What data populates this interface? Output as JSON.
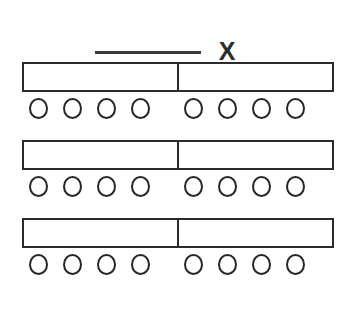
{
  "figure": {
    "background_color": "#ffffff",
    "stroke_color": "#2b2b2b",
    "width": 352,
    "height": 310
  },
  "legend": {
    "line_label": "X",
    "line_color": "#3a3a3a",
    "line_style": "solid"
  },
  "rows": [
    {
      "id": "row-1",
      "bar": {
        "segments": 2,
        "divider_position": "middle"
      },
      "counters": {
        "total": 8,
        "groups": [
          {
            "id": "left",
            "count": 4,
            "items": [
              "circle",
              "circle",
              "circle",
              "circle"
            ]
          },
          {
            "id": "right",
            "count": 4,
            "items": [
              "circle",
              "circle",
              "circle",
              "circle"
            ]
          }
        ]
      }
    },
    {
      "id": "row-2",
      "bar": {
        "segments": 2,
        "divider_position": "middle"
      },
      "counters": {
        "total": 8,
        "groups": [
          {
            "id": "left",
            "count": 4,
            "items": [
              "circle",
              "circle",
              "circle",
              "circle"
            ]
          },
          {
            "id": "right",
            "count": 4,
            "items": [
              "circle",
              "circle",
              "circle",
              "circle"
            ]
          }
        ]
      }
    },
    {
      "id": "row-3",
      "bar": {
        "segments": 2,
        "divider_position": "middle"
      },
      "counters": {
        "total": 8,
        "groups": [
          {
            "id": "left",
            "count": 4,
            "items": [
              "circle",
              "circle",
              "circle",
              "circle"
            ]
          },
          {
            "id": "right",
            "count": 4,
            "items": [
              "circle",
              "circle",
              "circle",
              "circle"
            ]
          }
        ]
      }
    }
  ]
}
